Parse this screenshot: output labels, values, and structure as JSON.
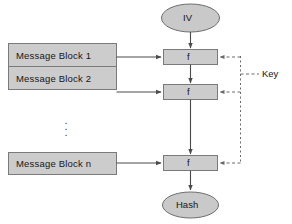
{
  "diagram": {
    "colors": {
      "box_fill": "#cccccc",
      "box_stroke": "#7a7a7a",
      "oval_fill": "#c9c9c9",
      "oval_stroke": "#6e6e6e",
      "arrow": "#4a4a4a",
      "dashed": "#6a6a6a",
      "background": "#ffffff",
      "text": "#161616"
    },
    "message_blocks": [
      {
        "id": "message-block-1",
        "label": "Message Block 1"
      },
      {
        "id": "message-block-2",
        "label": "Message Block 2"
      },
      {
        "id": "message-block-n",
        "label": "Message Block n"
      }
    ],
    "ellipsis": "⋮",
    "compression_functions": [
      {
        "id": "f-1",
        "label": "f"
      },
      {
        "id": "f-2",
        "label": "f"
      },
      {
        "id": "f-n",
        "label": "f"
      }
    ],
    "ovals": [
      {
        "id": "iv-oval",
        "label": "IV"
      },
      {
        "id": "hash-oval",
        "label": "Hash"
      }
    ],
    "key": {
      "label": "Key"
    }
  }
}
